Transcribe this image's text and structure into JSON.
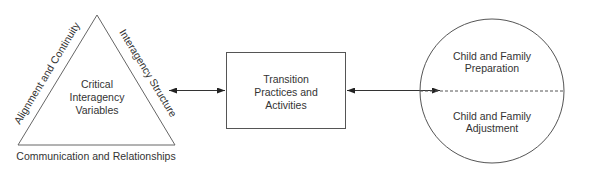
{
  "triangle": {
    "center_lines": [
      "Critical",
      "Interagency",
      "Variables"
    ],
    "left_side_label": "Alignment and Continuity",
    "right_side_label": "Interagency Structure",
    "base_label": "Communication and Relationships"
  },
  "box": {
    "lines": [
      "Transition",
      "Practices and",
      "Activities"
    ]
  },
  "circle": {
    "top_lines": [
      "Child and Family",
      "Preparation"
    ],
    "bottom_lines": [
      "Child and Family",
      "Adjustment"
    ]
  },
  "connectors": [
    {
      "from": "triangle",
      "to": "box",
      "type": "bidirectional-arrow"
    },
    {
      "from": "box",
      "to": "circle",
      "type": "bidirectional-arrow"
    }
  ],
  "colors": {
    "stroke": "#555555",
    "text": "#333333"
  }
}
